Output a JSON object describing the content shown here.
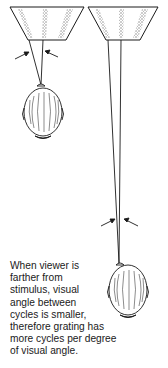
{
  "figure": {
    "panels": [
      {
        "id": "near",
        "label": "viewer close to stimulus",
        "arrows": "visual-angle-arrows"
      },
      {
        "id": "far",
        "label": "viewer farther from stimulus",
        "arrows": "visual-angle-arrows"
      }
    ],
    "caption_lines": [
      "When viewer is",
      "farther from",
      "stimulus, visual",
      "angle between",
      "cycles is smaller,",
      "therefore grating has",
      "more cycles per degree",
      "of visual angle."
    ],
    "colors": {
      "ink": "#1a1a1a",
      "grating": "#8a8a8a",
      "background": "#ffffff"
    }
  }
}
